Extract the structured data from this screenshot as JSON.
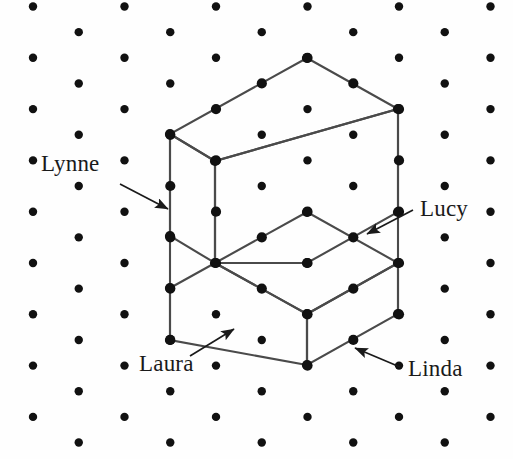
{
  "figure": {
    "type": "isometric-dot-grid-solid",
    "title": "",
    "background_color": "#fefefe",
    "dot_color": "#111111",
    "line_color": "#4a4a4a",
    "text_color": "#1a1a1a",
    "dot_radius": 4.2,
    "grid": {
      "description": "isometric triangular dot lattice",
      "x_spacing": 91.5,
      "y_spacing": 51.3,
      "x_offset_odd_row": 45.75,
      "origin_x": 33,
      "origin_y": 6.5,
      "columns": 6,
      "rows": 18
    },
    "solid": {
      "name": "L-shaped step solid",
      "faces": [
        {
          "name": "upper-block-top",
          "label": null
        },
        {
          "name": "upper-block-left",
          "label": "Lynne"
        },
        {
          "name": "upper-block-right",
          "label": "Lucy"
        },
        {
          "name": "lower-block-top",
          "label": null
        },
        {
          "name": "lower-block-left",
          "label": "Laura"
        },
        {
          "name": "lower-block-right",
          "label": "Linda"
        }
      ],
      "outline_points": "307,58 398,109 398,314 307,365 307,341 215,288 215,288 170,288 170,134 215,161",
      "polylines": {
        "upper_top_face": "307,58 398,109 215,161 170,134 307,58",
        "upper_left_face": "170,134 215,161 215,263 170,236 170,134",
        "upper_right_face": "215,161 398,109 398,212 307,263 215,263 215,161",
        "lower_top_face": "215,263 307,212 398,263 307,314 215,263",
        "lower_left_face": "170,288 215,263 307,314 307,365 170,340 170,288",
        "lower_right_face": "307,314 398,263 398,314 307,365 307,314",
        "front_vertical_edge": "307,314 307,365",
        "mid_vertical_edge": "215,161 215,263",
        "right_vertical_edge": "398,109 398,314",
        "left_vertical_edge": "170,134 170,340"
      }
    },
    "labels": [
      {
        "id": "lynne",
        "text": "Lynne",
        "text_x": 41,
        "text_y": 152,
        "arrow_from_x": 120,
        "arrow_from_y": 184,
        "arrow_to_x": 168,
        "arrow_to_y": 209,
        "points_to_face": "upper-block-left"
      },
      {
        "id": "lucy",
        "text": "Lucy",
        "text_x": 420,
        "text_y": 197,
        "arrow_from_x": 413,
        "arrow_from_y": 210,
        "arrow_to_x": 367,
        "arrow_to_y": 234,
        "points_to_face": "upper-block-right"
      },
      {
        "id": "laura",
        "text": "Laura",
        "text_x": 139,
        "text_y": 352,
        "arrow_from_x": 190,
        "arrow_from_y": 356,
        "arrow_to_x": 234,
        "arrow_to_y": 329,
        "points_to_face": "lower-block-left"
      },
      {
        "id": "linda",
        "text": "Linda",
        "text_x": 408,
        "text_y": 357,
        "arrow_from_x": 400,
        "arrow_from_y": 367,
        "arrow_to_x": 355,
        "arrow_to_y": 348,
        "points_to_face": "lower-block-right"
      }
    ]
  }
}
